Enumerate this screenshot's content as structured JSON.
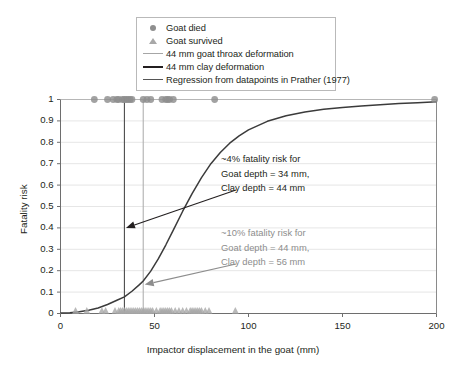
{
  "chart_data": {
    "type": "line",
    "title": "",
    "xlabel": "Impactor displacement in the goat (mm)",
    "ylabel": "Fatality risk",
    "xlim": [
      0,
      200
    ],
    "ylim": [
      0,
      1
    ],
    "xticks": [
      0,
      50,
      100,
      150,
      200
    ],
    "xtick_labels": [
      "0",
      "50",
      "100",
      "150",
      "200"
    ],
    "yticks": [
      0,
      0.1,
      0.2,
      0.3,
      0.4,
      0.5,
      0.6,
      0.7,
      0.8,
      0.9,
      1
    ],
    "ytick_labels": [
      "0",
      "0.1",
      "0.2",
      "0.3",
      "0.4",
      "0.5",
      "0.6",
      "0.7",
      "0.8",
      "0.9",
      "1"
    ],
    "grid": true,
    "legend_position": "top-center",
    "legend": [
      {
        "label": "Goat died",
        "marker": "circle",
        "color": "#8e8e8e"
      },
      {
        "label": "Goat survived",
        "marker": "triangle",
        "color": "#a8a8a8"
      },
      {
        "label": "44 mm goat throax deformation",
        "marker": "line-thin-grey",
        "color": "#a6a6a6"
      },
      {
        "label": "44 mm clay deformation",
        "marker": "line-thick-dark",
        "color": "#231f20"
      },
      {
        "label": "Regression from datapoints in Prather (1977)",
        "marker": "line-med-dark",
        "color": "#555555"
      }
    ],
    "series": [
      {
        "name": "Regression from datapoints in Prather (1977)",
        "type": "line",
        "color": "#3b3b3b",
        "x": [
          0,
          5,
          10,
          15,
          20,
          25,
          30,
          34,
          38,
          42,
          44,
          48,
          52,
          56,
          60,
          65,
          70,
          75,
          80,
          85,
          90,
          95,
          100,
          110,
          120,
          130,
          140,
          150,
          160,
          170,
          180,
          190,
          200
        ],
        "y": [
          0.002,
          0.004,
          0.008,
          0.015,
          0.026,
          0.042,
          0.062,
          0.078,
          0.104,
          0.135,
          0.152,
          0.198,
          0.255,
          0.32,
          0.39,
          0.478,
          0.56,
          0.635,
          0.7,
          0.752,
          0.796,
          0.83,
          0.858,
          0.898,
          0.924,
          0.942,
          0.954,
          0.963,
          0.97,
          0.976,
          0.981,
          0.985,
          0.989
        ]
      },
      {
        "name": "Goat died",
        "type": "scatter",
        "marker": "circle",
        "color": "#8e8e8e",
        "y_value": 1,
        "x": [
          18,
          25,
          28,
          30,
          31,
          33,
          34,
          35,
          36,
          37,
          38,
          44,
          46,
          48,
          54,
          56,
          57,
          58,
          60,
          82,
          199
        ]
      },
      {
        "name": "Goat survived",
        "type": "scatter",
        "marker": "triangle",
        "color": "#a8a8a8",
        "y_value": 0,
        "x": [
          8,
          14,
          22,
          24,
          29,
          31,
          32,
          33,
          34,
          35,
          36,
          37,
          38,
          39,
          40,
          41,
          42,
          43,
          44,
          45,
          46,
          47,
          48,
          49,
          51,
          53,
          54,
          55,
          56,
          57,
          58,
          59,
          61,
          63,
          65,
          67,
          69,
          70,
          71,
          72,
          73,
          74,
          75,
          77,
          79,
          93
        ]
      }
    ],
    "reference_lines": [
      {
        "name": "44 mm clay deformation",
        "x": 34,
        "color": "#4d4d4d",
        "width": 1.1
      },
      {
        "name": "44 mm goat throax deformation",
        "x": 44,
        "color": "#b0b0b0",
        "width": 1.1
      }
    ],
    "annotations": [
      {
        "id": "annotation-clay",
        "color": "#231f20",
        "lines": [
          "~4% fatality risk for",
          "Goat depth = 34 mm,",
          "Clay depth = 44 mm"
        ],
        "arrow_to_x": 34,
        "arrow_to_y": 0.4
      },
      {
        "id": "annotation-goat",
        "color": "#8d8d8d",
        "lines": [
          "~10% fatality risk for",
          "Goat depth = 44 mm,",
          "Clay depth = 56 mm"
        ],
        "arrow_to_x": 44,
        "arrow_to_y": 0.135
      }
    ]
  },
  "axes": {
    "y_label": "Fatality risk",
    "x_label": "Impactor displacement in the goat (mm)",
    "y_ticks": [
      "1",
      "0.9",
      "0.8",
      "0.7",
      "0.6",
      "0.5",
      "0.4",
      "0.3",
      "0.2",
      "0.1",
      "0"
    ],
    "x_ticks": [
      "0",
      "50",
      "100",
      "150",
      "200"
    ]
  },
  "legend": {
    "items": [
      {
        "label": "Goat died"
      },
      {
        "label": "Goat survived"
      },
      {
        "label": "44 mm goat throax deformation"
      },
      {
        "label": "44 mm clay deformation"
      },
      {
        "label": "Regression from datapoints in Prather (1977)"
      }
    ]
  },
  "annotations": {
    "clay": {
      "line1": "~4% fatality risk for",
      "line2": "Goat depth = 34 mm,",
      "line3": "Clay depth = 44 mm"
    },
    "goat": {
      "line1": "~10% fatality risk for",
      "line2": "Goat depth = 44 mm,",
      "line3": "Clay depth = 56 mm"
    }
  }
}
